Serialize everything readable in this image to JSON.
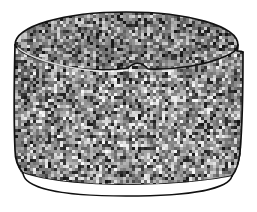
{
  "figure": {
    "subject_name": "cylinder-container",
    "description": "Line drawing of an open cylindrical vessel seen from slightly above, filled with a coarse granular grey texture. The elliptical top opening, an inner rim arc, a small step notch on the right wall, and a pale base lip band are all visible.",
    "background_color": "#ffffff",
    "outline_color": "#111111",
    "texture": {
      "name": "granular-noise",
      "mean_gray": "#8e8e8e",
      "light_gray": "#e8e8e8",
      "dark_gray": "#222222",
      "grain_size_px": 3,
      "seed": 20240517,
      "cell_count": 9000
    },
    "parts": [
      {
        "id": "top-rim-ellipse",
        "label": "Top rim opening",
        "stroke_width": 1.6
      },
      {
        "id": "inner-rim-arc",
        "label": "Inner front rim arc",
        "stroke_width": 1.6
      },
      {
        "id": "left-wall",
        "label": "Left side wall",
        "stroke_width": 1.6
      },
      {
        "id": "right-wall",
        "label": "Right side wall",
        "stroke_width": 1.6
      },
      {
        "id": "right-notch",
        "label": "Right side step notch",
        "stroke_width": 1.6
      },
      {
        "id": "base-lip",
        "label": "Base lip band",
        "fill": "#ffffff",
        "stroke_width": 1.4
      },
      {
        "id": "base-bottom-arc",
        "label": "Bottom outline arc",
        "stroke_width": 1.4
      }
    ],
    "geometry": {
      "top_ellipse_cx": 126,
      "top_ellipse_cy": 45,
      "top_ellipse_rx": 112,
      "top_ellipse_ry": 33,
      "body_left_x": 15,
      "body_right_x": 243,
      "body_bottom_y": 180,
      "base_lip_bottom_y": 196
    }
  }
}
